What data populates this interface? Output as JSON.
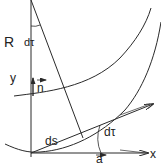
{
  "diagram": {
    "type": "geometry-curvature",
    "colors": {
      "stroke": "#2a2a2a",
      "text": "#222222",
      "background": "#ffffff"
    },
    "labels": {
      "radius": "R",
      "angle_top": "dτ",
      "y_axis": "y",
      "normal_vector": "n",
      "arc_length": "ds",
      "angle_bottom": "dτ",
      "tangent_vector": "a",
      "x_axis": "x"
    },
    "elements": [
      {
        "name": "y-axis",
        "kind": "line"
      },
      {
        "name": "x-axis",
        "kind": "arrow"
      },
      {
        "name": "radius-line",
        "kind": "line"
      },
      {
        "name": "inner-arc",
        "kind": "curve"
      },
      {
        "name": "outer-arc",
        "kind": "curve"
      },
      {
        "name": "tangent-arrow",
        "kind": "arrow"
      },
      {
        "name": "normal-arrow",
        "kind": "arrow"
      },
      {
        "name": "tangent-unit-arrow",
        "kind": "arrow"
      },
      {
        "name": "angle-arc-top",
        "kind": "arc"
      },
      {
        "name": "angle-arc-bottom",
        "kind": "arc"
      }
    ]
  }
}
